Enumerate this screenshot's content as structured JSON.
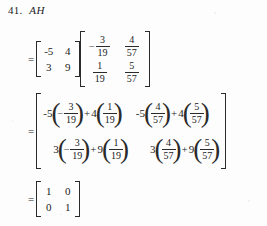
{
  "problem": {
    "number": "41.",
    "expression": "AH"
  },
  "step1": {
    "equals": "=",
    "matrix_a": {
      "rows": [
        [
          "-5",
          "4"
        ],
        [
          "3",
          "9"
        ]
      ]
    },
    "matrix_h": {
      "rows": [
        [
          {
            "sign": "−",
            "num": "3",
            "den": "19"
          },
          {
            "sign": "",
            "num": "4",
            "den": "57"
          }
        ],
        [
          {
            "sign": "",
            "num": "1",
            "den": "19"
          },
          {
            "sign": "",
            "num": "5",
            "den": "57"
          }
        ]
      ]
    }
  },
  "step2": {
    "equals": "=",
    "cells": [
      [
        {
          "c1": "-5",
          "s1": "−",
          "n1": "3",
          "d1": "19",
          "op": "+",
          "c2": "4",
          "s2": "",
          "n2": "1",
          "d2": "19"
        },
        {
          "c1": "-5",
          "s1": "",
          "n1": "4",
          "d1": "57",
          "op": "+",
          "c2": "4",
          "s2": "",
          "n2": "5",
          "d2": "57"
        }
      ],
      [
        {
          "c1": "3",
          "s1": "−",
          "n1": "3",
          "d1": "19",
          "op": "+",
          "c2": "9",
          "s2": "",
          "n2": "1",
          "d2": "19"
        },
        {
          "c1": "3",
          "s1": "",
          "n1": "4",
          "d1": "57",
          "op": "+",
          "c2": "9",
          "s2": "",
          "n2": "5",
          "d2": "57"
        }
      ]
    ]
  },
  "step3": {
    "equals": "=",
    "matrix_identity": {
      "rows": [
        [
          "1",
          "0"
        ],
        [
          "0",
          "1"
        ]
      ]
    }
  },
  "colors": {
    "ink": "#1b1b1b",
    "paper": "#fdfdfd",
    "rule": "#2a2a2a"
  }
}
